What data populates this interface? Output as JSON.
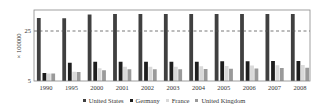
{
  "chart_data": {
    "type": "bar",
    "title": "",
    "xlabel": "",
    "ylabel": "× 100000",
    "ylim": [
      5,
      33
    ],
    "yticks": [
      5,
      25
    ],
    "reference_line": {
      "y": 25,
      "style": "dashed"
    },
    "grid": false,
    "legend_position": "bottom",
    "categories": [
      "1990",
      "1995",
      "2000",
      "2001",
      "2002",
      "2003",
      "2004",
      "2005",
      "2006",
      "2007",
      "2008"
    ],
    "series": [
      {
        "name": "United States",
        "color": "#404040",
        "values": [
          30.2,
          30.1,
          31.6,
          31.8,
          31.8,
          31.8,
          31.8,
          31.8,
          31.8,
          31.8,
          31.8
        ]
      },
      {
        "name": "Germany",
        "color": "#1e1e1e",
        "values": [
          8.2,
          12.3,
          12.7,
          12.7,
          12.7,
          12.7,
          12.7,
          12.9,
          12.9,
          13.0,
          13.0
        ]
      },
      {
        "name": "France",
        "color": "#d9d9d9",
        "values": [
          8.0,
          8.7,
          10.1,
          10.7,
          10.7,
          10.7,
          10.9,
          11.0,
          11.2,
          11.3,
          11.4
        ]
      },
      {
        "name": "United Kingdom",
        "color": "#9a9a9a",
        "values": [
          8.0,
          8.6,
          9.3,
          9.7,
          9.7,
          9.7,
          9.8,
          9.9,
          10.0,
          10.2,
          10.3
        ]
      }
    ]
  }
}
